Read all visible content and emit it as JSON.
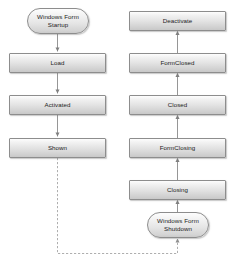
{
  "diagram": {
    "colors": {
      "node_border": "#8d8d8d",
      "node_fill_top": "#fdfdfd",
      "node_fill_bottom": "#c8c8c8",
      "edge": "#8a8a8a",
      "dashed_edge": "#9a9a9a",
      "text": "#1c1c1c",
      "background": "#ffffff"
    },
    "nodes": [
      {
        "id": "startup",
        "label": "Windows Form\nStartup",
        "shape": "terminator",
        "column": "left",
        "x": 27,
        "y": 8,
        "w": 62,
        "h": 26
      },
      {
        "id": "load",
        "label": "Load",
        "shape": "process",
        "column": "left",
        "x": 9,
        "y": 53,
        "w": 97,
        "h": 20
      },
      {
        "id": "activated",
        "label": "Activated",
        "shape": "process",
        "column": "left",
        "x": 9,
        "y": 95,
        "w": 97,
        "h": 20
      },
      {
        "id": "shown",
        "label": "Shown",
        "shape": "process",
        "column": "left",
        "x": 9,
        "y": 138,
        "w": 97,
        "h": 20
      },
      {
        "id": "deactivate",
        "label": "Deactivate",
        "shape": "process",
        "column": "right",
        "x": 129,
        "y": 11,
        "w": 97,
        "h": 20
      },
      {
        "id": "formclosed",
        "label": "FormClosed",
        "shape": "process",
        "column": "right",
        "x": 129,
        "y": 53,
        "w": 97,
        "h": 20
      },
      {
        "id": "closed",
        "label": "Closed",
        "shape": "process",
        "column": "right",
        "x": 129,
        "y": 95,
        "w": 97,
        "h": 20
      },
      {
        "id": "formclosing",
        "label": "FormClosing",
        "shape": "process",
        "column": "right",
        "x": 129,
        "y": 138,
        "w": 97,
        "h": 20
      },
      {
        "id": "closing",
        "label": "Closing",
        "shape": "process",
        "column": "right",
        "x": 129,
        "y": 180,
        "w": 97,
        "h": 20
      },
      {
        "id": "shutdown",
        "label": "Windows Form\nShutdown",
        "shape": "terminator",
        "column": "right",
        "x": 147,
        "y": 212,
        "w": 62,
        "h": 26
      }
    ],
    "edges": [
      {
        "id": "startup-to-load",
        "from": "startup",
        "to": "load",
        "style": "solid",
        "direction": "down"
      },
      {
        "id": "load-to-activated",
        "from": "load",
        "to": "activated",
        "style": "solid",
        "direction": "down"
      },
      {
        "id": "activated-to-shown",
        "from": "activated",
        "to": "shown",
        "style": "solid",
        "direction": "down"
      },
      {
        "id": "shown-to-shutdown",
        "from": "shown",
        "to": "shutdown",
        "style": "dashed",
        "direction": "up"
      },
      {
        "id": "shutdown-to-closing",
        "from": "shutdown",
        "to": "closing",
        "style": "solid",
        "direction": "up"
      },
      {
        "id": "closing-to-formclosing",
        "from": "closing",
        "to": "formclosing",
        "style": "solid",
        "direction": "up"
      },
      {
        "id": "formclosing-to-closed",
        "from": "formclosing",
        "to": "closed",
        "style": "solid",
        "direction": "up"
      },
      {
        "id": "closed-to-formclosed",
        "from": "closed",
        "to": "formclosed",
        "style": "solid",
        "direction": "up"
      },
      {
        "id": "formclosed-to-deactivate",
        "from": "formclosed",
        "to": "deactivate",
        "style": "solid",
        "direction": "up"
      }
    ]
  }
}
